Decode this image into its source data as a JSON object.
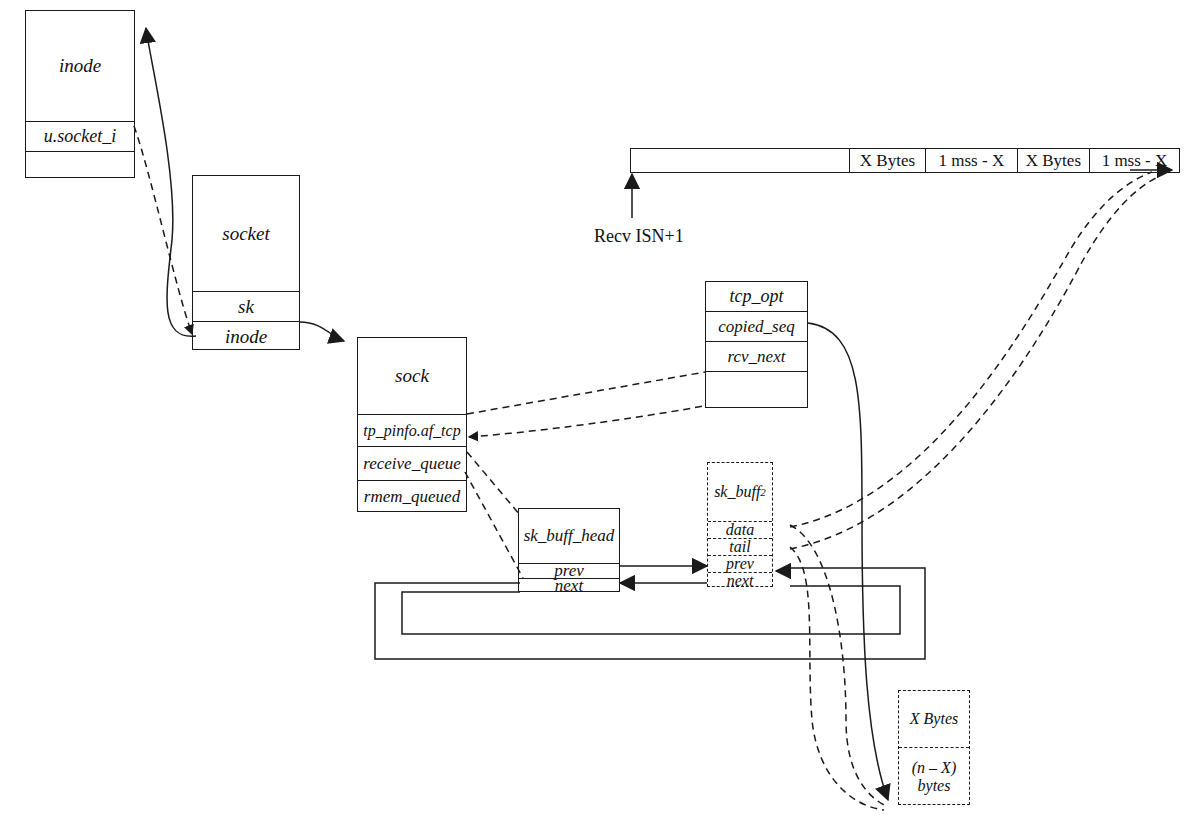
{
  "diagram": {
    "structs": [
      {
        "id": "inode",
        "name": "inode",
        "fields": [
          "u.socket_i",
          ""
        ]
      },
      {
        "id": "socket",
        "name": "socket",
        "fields": [
          "sk",
          "inode"
        ]
      },
      {
        "id": "sock",
        "name": "sock",
        "fields": [
          "tp_pinfo.af_tcp",
          "receive_queue",
          "rmem_queued"
        ]
      },
      {
        "id": "tcp_opt",
        "name": "tcp_opt",
        "fields": [
          "copied_seq",
          "rcv_next",
          ""
        ]
      },
      {
        "id": "sk_buff_head",
        "name": "sk_buff_head",
        "fields": [
          "prev",
          "next"
        ]
      },
      {
        "id": "sk_buff2",
        "name": "sk_buff",
        "name_subscript": "2",
        "fields": [
          "data",
          "tail",
          "prev",
          "next"
        ]
      }
    ],
    "sequence_bar": {
      "marker_label": "Recv ISN+1",
      "segments": [
        {
          "label": "",
          "width_px": 230
        },
        {
          "label": "X Bytes",
          "width_px": 80
        },
        {
          "label": "1 mss - X",
          "width_px": 97
        },
        {
          "label": "X Bytes",
          "width_px": 76
        },
        {
          "label": "1 mss - X",
          "width_px": 96
        }
      ]
    },
    "data_block": {
      "segments": [
        "X Bytes",
        "(n – X) bytes"
      ]
    },
    "colors": {
      "stroke": "#1a1a1a",
      "background": "#ffffff"
    }
  }
}
